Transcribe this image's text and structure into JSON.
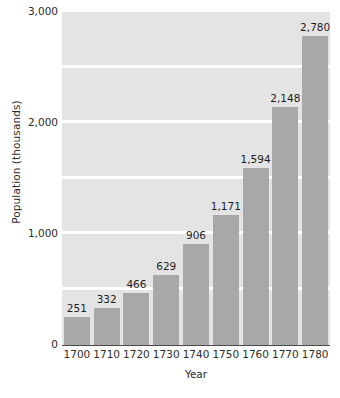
{
  "chart_data": {
    "type": "bar",
    "title": "",
    "subtitle": "",
    "xlabel": "Year",
    "ylabel": "Population (thousands)",
    "categories": [
      "1700",
      "1710",
      "1720",
      "1730",
      "1740",
      "1750",
      "1760",
      "1770",
      "1780"
    ],
    "values": [
      251,
      332,
      466,
      629,
      906,
      1171,
      1594,
      2148,
      2780
    ],
    "value_labels": [
      "251",
      "332",
      "466",
      "629",
      "906",
      "1,171",
      "1,594",
      "2,148",
      "2,780"
    ],
    "ylim": [
      0,
      3000
    ],
    "ytick_values": [
      0,
      1000,
      2000,
      3000
    ],
    "ytick_labels": [
      "0",
      "1,000",
      "2,000",
      "3,000"
    ],
    "gridline_values": [
      500,
      1000,
      1500,
      2000,
      2500,
      3000
    ],
    "grid": true,
    "legend": false,
    "legend_position": "none",
    "colors": {
      "bar": "#a8a8a8",
      "plot_background": "#e4e4e4",
      "gridline": "#ffffff",
      "axis": "#4a4a4a",
      "text": "#2b2b2b",
      "page_background": "#ffffff"
    }
  }
}
